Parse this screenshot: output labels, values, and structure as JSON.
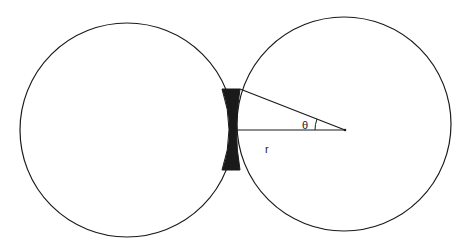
{
  "diagram": {
    "labels": {
      "angle": "θ",
      "radius": "r"
    },
    "colors": {
      "stroke": "#1a1a1a",
      "bridge_fill": "#1a1a1a",
      "background": "#ffffff"
    }
  }
}
